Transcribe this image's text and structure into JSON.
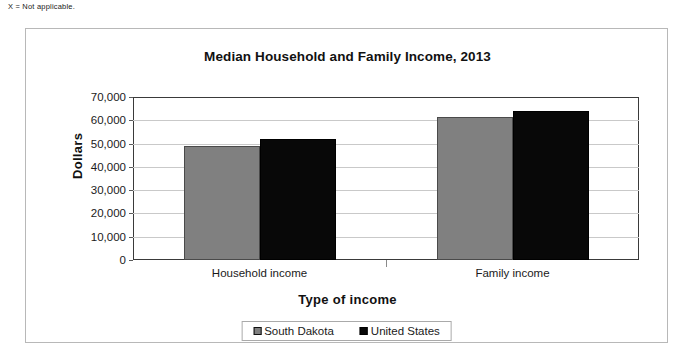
{
  "footnote": "X = Not applicable.",
  "chart_data": {
    "type": "bar",
    "title": "Median Household and Family Income, 2013",
    "xlabel": "Type of income",
    "ylabel": "Dollars",
    "categories": [
      "Household income",
      "Family income"
    ],
    "series": [
      {
        "name": "South Dakota",
        "color": "#808080",
        "values": [
          49000,
          61500
        ]
      },
      {
        "name": "United States",
        "color": "#080808",
        "values": [
          52000,
          64000
        ]
      }
    ],
    "ylim": [
      0,
      70000
    ],
    "ytick_labels": [
      "70,000",
      "60,000",
      "50,000",
      "40,000",
      "30,000",
      "20,000",
      "10,000",
      "0"
    ],
    "ytick_values": [
      70000,
      60000,
      50000,
      40000,
      30000,
      20000,
      10000,
      0
    ],
    "grid": true,
    "legend_position": "bottom"
  }
}
